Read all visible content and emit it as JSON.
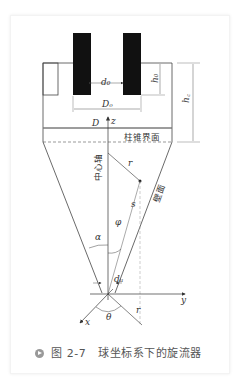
{
  "figure": {
    "caption_number": "图 2-7",
    "caption_text": "球坐标系下的旋流器",
    "labels": {
      "d0": "d₀",
      "h0": "h₀",
      "Do": "Dₒ",
      "hc": "h꜀",
      "D": "D",
      "z": "z",
      "interface": "柱锥界面",
      "center_axis": "中心轴",
      "wall": "壁面",
      "r": "r",
      "s": "s",
      "phi": "φ",
      "alpha": "α",
      "du": "dᵤ",
      "y": "y",
      "x": "x",
      "theta": "θ",
      "r2": "r"
    }
  }
}
